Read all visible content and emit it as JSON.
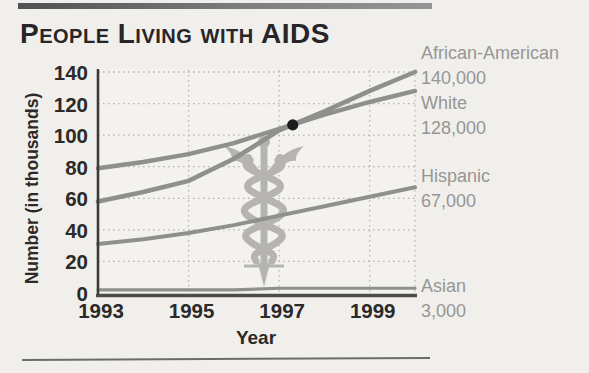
{
  "page": {
    "heading": "People Living with AIDS"
  },
  "chart_data": {
    "type": "line",
    "title": "People Living with AIDS",
    "xlabel": "Year",
    "ylabel": "Number (in thousands)",
    "xlim": [
      1993,
      2000
    ],
    "ylim": [
      0,
      140
    ],
    "x_ticks": [
      1993,
      1995,
      1997,
      1999
    ],
    "y_ticks": [
      0,
      20,
      40,
      60,
      80,
      100,
      120,
      140
    ],
    "grid": "dotted",
    "legend_position": "right",
    "line_color": "#8f8f8e",
    "series": [
      {
        "name": "African-American",
        "end_label": "140,000",
        "x": [
          1993,
          1994,
          1995,
          1996,
          1997,
          1998,
          1999,
          2000
        ],
        "values": [
          58,
          64,
          71,
          85,
          103,
          115,
          128,
          140
        ]
      },
      {
        "name": "White",
        "end_label": "128,000",
        "x": [
          1993,
          1994,
          1995,
          1996,
          1997,
          1998,
          1999,
          2000
        ],
        "values": [
          79,
          83,
          88,
          95,
          104,
          113,
          121,
          128
        ]
      },
      {
        "name": "Hispanic",
        "end_label": "67,000",
        "x": [
          1993,
          1994,
          1995,
          1996,
          1997,
          1998,
          1999,
          2000
        ],
        "values": [
          31,
          34,
          38,
          43,
          49,
          55,
          61,
          67
        ]
      },
      {
        "name": "Asian",
        "end_label": "3,000",
        "x": [
          1993,
          1994,
          1995,
          1996,
          1997,
          1998,
          1999,
          2000
        ],
        "values": [
          2,
          2,
          2,
          2,
          3,
          3,
          3,
          3
        ]
      }
    ],
    "annotation_point": {
      "x": 1997.3,
      "y": 106.5,
      "description": "Point where African-American line crosses above White line"
    }
  },
  "icons": {
    "watermark": "caduceus-medical-symbol"
  }
}
